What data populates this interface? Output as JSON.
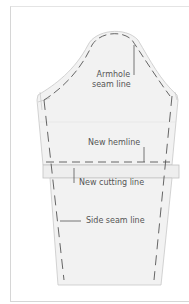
{
  "diagram": {
    "labels": {
      "armhole_line1": "Armhole",
      "armhole_line2": "seam line",
      "new_hemline": "New hemline",
      "new_cutting_line": "New cutting line",
      "side_seam_line": "Side seam line"
    },
    "colors": {
      "pattern_fill": "#f2f2f2",
      "pattern_outline": "#c8c8c8",
      "dashed_line": "#555555",
      "leader_line": "#555555",
      "text": "#555555"
    }
  }
}
